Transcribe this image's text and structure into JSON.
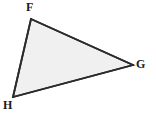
{
  "figure": {
    "kind": "geometry-diagram",
    "shape_name": "triangle",
    "canvas": {
      "width": 156,
      "height": 114,
      "background_color": "#ffffff"
    },
    "style": {
      "fill_color": "#f0f0f0",
      "stroke_color": "#2b2b2b",
      "stroke_width": 1.8,
      "label_color": "#1a1a1a",
      "label_font_size": 12,
      "label_font_weight": "bold"
    },
    "vertices": [
      {
        "id": "F",
        "label": "F",
        "x": 31,
        "y": 19,
        "label_x": 26,
        "label_y": 1,
        "label_position": "above-left"
      },
      {
        "id": "G",
        "label": "G",
        "x": 133,
        "y": 65,
        "label_x": 136,
        "label_y": 58,
        "label_position": "right"
      },
      {
        "id": "H",
        "label": "H",
        "x": 13,
        "y": 97,
        "label_x": 3,
        "label_y": 99,
        "label_position": "below-left"
      }
    ],
    "edges": [
      {
        "id": "FG",
        "from": "F",
        "to": "G"
      },
      {
        "id": "GH",
        "from": "G",
        "to": "H"
      },
      {
        "id": "HF",
        "from": "H",
        "to": "F"
      }
    ],
    "polygon_points": "31,19 133,65 13,97"
  }
}
